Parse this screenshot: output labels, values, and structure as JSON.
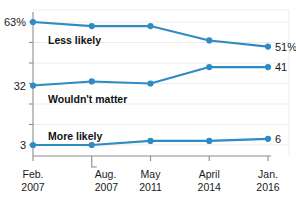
{
  "chart_data": {
    "type": "line",
    "title": "",
    "subtitle": "",
    "xlabel": "",
    "ylabel": "",
    "ylim": [
      0,
      70
    ],
    "grid": true,
    "legend_position": "inline",
    "categories": [
      "Feb. 2007",
      "Aug. 2007",
      "May 2011",
      "April 2014",
      "Jan. 2016"
    ],
    "category_lines": [
      {
        "month": "Feb.",
        "year": "2007"
      },
      {
        "month": "Aug.",
        "year": "2007"
      },
      {
        "month": "May",
        "year": "2011"
      },
      {
        "month": "April",
        "year": "2014"
      },
      {
        "month": "Jan.",
        "year": "2016"
      }
    ],
    "series": [
      {
        "name": "Less likely",
        "color": "#2e8bc4",
        "values": [
          63,
          61,
          61,
          54,
          51
        ],
        "start_label": "63%",
        "end_label": "51%"
      },
      {
        "name": "Wouldn't matter",
        "color": "#2e8bc4",
        "values": [
          32,
          34,
          33,
          41,
          41
        ],
        "start_label": "32",
        "end_label": "41"
      },
      {
        "name": "More likely",
        "color": "#2e8bc4",
        "values": [
          3,
          3,
          5,
          5,
          6
        ],
        "start_label": "3",
        "end_label": "6"
      }
    ],
    "y_axis_labels": [
      "63%",
      "32",
      "3"
    ],
    "colors": {
      "line": "#2e8bc4",
      "axis": "#8d8d8d",
      "grid": "#ececec",
      "text": "#1a1a1a",
      "background": "#ffffff"
    }
  }
}
